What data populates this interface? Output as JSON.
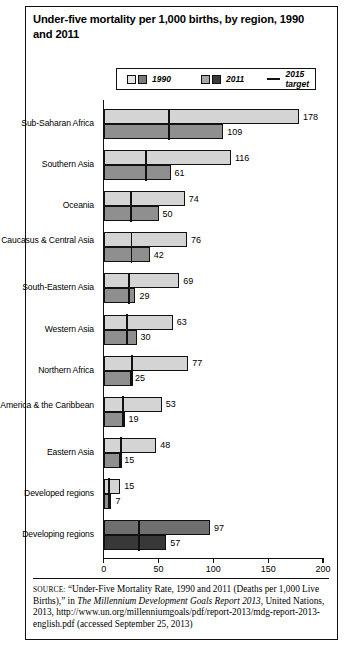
{
  "figure": {
    "title": "Under-five mortality per 1,000 births, by region, 1990 and 2011",
    "source_prefix": "SOURCE:",
    "source_part1": " “Under-Five Mortality Rate, 1990 and 2011 (Deaths per 1,000 Live Births),” in ",
    "source_italic": "The Millennium Development Goals Report 2013",
    "source_part2": ", United Nations, 2013, http://www.un.org/millenniumgoals/pdf/report-2013/mdg-report-2013-english.pdf (accessed September 25, 2013)"
  },
  "legend": {
    "items": [
      {
        "label": "1990",
        "swatches": [
          "#e3e3e3",
          "#7a7a7a"
        ],
        "type": "swatch-pair"
      },
      {
        "label": "2011",
        "swatches": [
          "#a8a8a8",
          "#3a3a3a"
        ],
        "type": "swatch-pair"
      },
      {
        "label": "2015 target",
        "type": "line",
        "color": "#111111"
      }
    ]
  },
  "colors": {
    "bar_1990_light": "#d4d4d4",
    "bar_2011_mid": "#8f8f8f",
    "bar_1990_dark": "#6f6f6f",
    "bar_2011_dark": "#383838",
    "target_line": "#111111",
    "axis": "#111111"
  },
  "chart_data": {
    "type": "bar",
    "orientation": "horizontal",
    "title": "Under-five mortality per 1,000 births, by region, 1990 and 2011",
    "xlabel": "",
    "ylabel": "",
    "xlim": [
      0,
      200
    ],
    "xticks": [
      0,
      50,
      100,
      150,
      200
    ],
    "xticklabels": [
      "0",
      "50",
      "100",
      "150",
      "200"
    ],
    "grid": false,
    "legend_position": "top-center",
    "categories": [
      "Sub-Saharan Africa",
      "Southern Asia",
      "Oceania",
      "Caucasus & Central Asia",
      "South-Eastern Asia",
      "Western Asia",
      "Northern Africa",
      "Latin America & the Caribbean",
      "Eastern Asia",
      "Developed regions",
      "Developing regions"
    ],
    "series": [
      {
        "name": "1990",
        "values": [
          178,
          116,
          74,
          76,
          69,
          63,
          77,
          53,
          48,
          15,
          97
        ]
      },
      {
        "name": "2011",
        "values": [
          109,
          61,
          50,
          42,
          29,
          30,
          25,
          19,
          15,
          7,
          57
        ]
      },
      {
        "name": "2015 target",
        "values": [
          59.3,
          38.7,
          24.7,
          25.3,
          23.0,
          21.0,
          25.7,
          17.7,
          16.0,
          5.0,
          32.3
        ]
      }
    ],
    "row_styles": [
      "light",
      "light",
      "light",
      "light",
      "light",
      "light",
      "light",
      "light",
      "light",
      "light",
      "dark"
    ]
  }
}
